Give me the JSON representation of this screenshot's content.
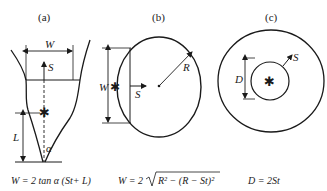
{
  "panels": [
    {
      "id": "a",
      "label": "(a)",
      "description": "V-shaped funnel cross-section with growth from point",
      "symbols": {
        "width": "W",
        "growth": "S",
        "length": "L",
        "angle": "α"
      },
      "equation": "W = 2 tan α (St+ L)"
    },
    {
      "id": "b",
      "label": "(b)",
      "description": "Circle with chord at distance St from edge",
      "symbols": {
        "width": "W",
        "growth": "S",
        "radius": "R"
      },
      "equation_prefix": "W = 2",
      "equation_radicand": "R² − (R − St)²"
    },
    {
      "id": "c",
      "label": "(c)",
      "description": "Concentric circles with central source",
      "symbols": {
        "diameter": "D",
        "growth": "S"
      },
      "equation": "D = 2St"
    }
  ],
  "colors": {
    "line": "#1a1a1a",
    "background": "#ffffff"
  }
}
